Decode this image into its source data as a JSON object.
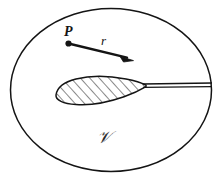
{
  "figure": {
    "background_color": "#ffffff",
    "ink_color": "#141414",
    "width": 222,
    "height": 181
  },
  "labels": {
    "point_label": "P",
    "vector_label": "r",
    "volume_label": "𝒱"
  },
  "annotations": {
    "point_marker_name": "point-p-dot",
    "vector_arrow_name": "position-vector-arrow",
    "boundary_name": "control-volume-boundary-ellipse",
    "body_name": "airfoil-cross-section",
    "hatch_name": "airfoil-hatching",
    "cut_name": "branch-cut-slit"
  },
  "geometry": {
    "ellipse": {
      "cx": 111,
      "cy": 90,
      "rx": 101,
      "ry": 82
    },
    "point_p": {
      "x": 68,
      "y": 43
    },
    "vector_tip": {
      "x": 130,
      "y": 59
    },
    "airfoil_tip_left": {
      "x": 56,
      "y": 95
    },
    "airfoil_trailing_edge": {
      "x": 146,
      "y": 86
    },
    "cut_end": {
      "x": 212,
      "y": 85
    }
  },
  "colors": {
    "stroke": "#141414",
    "hatch": "#1d1d1d",
    "fill": "#ffffff"
  }
}
